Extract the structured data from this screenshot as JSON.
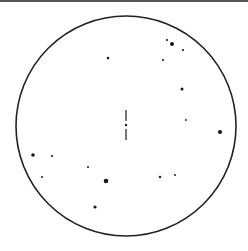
{
  "diagram": {
    "type": "star-field-chart",
    "frame": {
      "cx": 126,
      "cy": 126,
      "r": 110,
      "stroke": "#222222",
      "stroke_width": 1.6
    },
    "top_rule_color": "#555555",
    "center_marker": {
      "x": 126,
      "segments": [
        {
          "y1": 110,
          "y2": 121
        },
        {
          "y1": 129,
          "y2": 140
        }
      ],
      "dot": {
        "y": 125,
        "r": 1.2
      }
    },
    "stars": [
      {
        "x": 108,
        "y": 58,
        "r": 1.3
      },
      {
        "x": 167,
        "y": 40,
        "r": 1.1
      },
      {
        "x": 172,
        "y": 44,
        "r": 2.0
      },
      {
        "x": 183,
        "y": 50,
        "r": 1.1
      },
      {
        "x": 163,
        "y": 60,
        "r": 1.1
      },
      {
        "x": 182,
        "y": 89,
        "r": 1.5
      },
      {
        "x": 186,
        "y": 120,
        "r": 0.9
      },
      {
        "x": 220,
        "y": 132,
        "r": 2.1
      },
      {
        "x": 33,
        "y": 155,
        "r": 1.8
      },
      {
        "x": 52,
        "y": 156,
        "r": 1.1
      },
      {
        "x": 88,
        "y": 167,
        "r": 1.0
      },
      {
        "x": 42,
        "y": 177,
        "r": 1.0
      },
      {
        "x": 106,
        "y": 181,
        "r": 2.3
      },
      {
        "x": 160,
        "y": 177,
        "r": 1.2
      },
      {
        "x": 175,
        "y": 175,
        "r": 1.0
      },
      {
        "x": 95,
        "y": 207,
        "r": 1.6
      }
    ],
    "star_color": "#1a1a1a"
  }
}
